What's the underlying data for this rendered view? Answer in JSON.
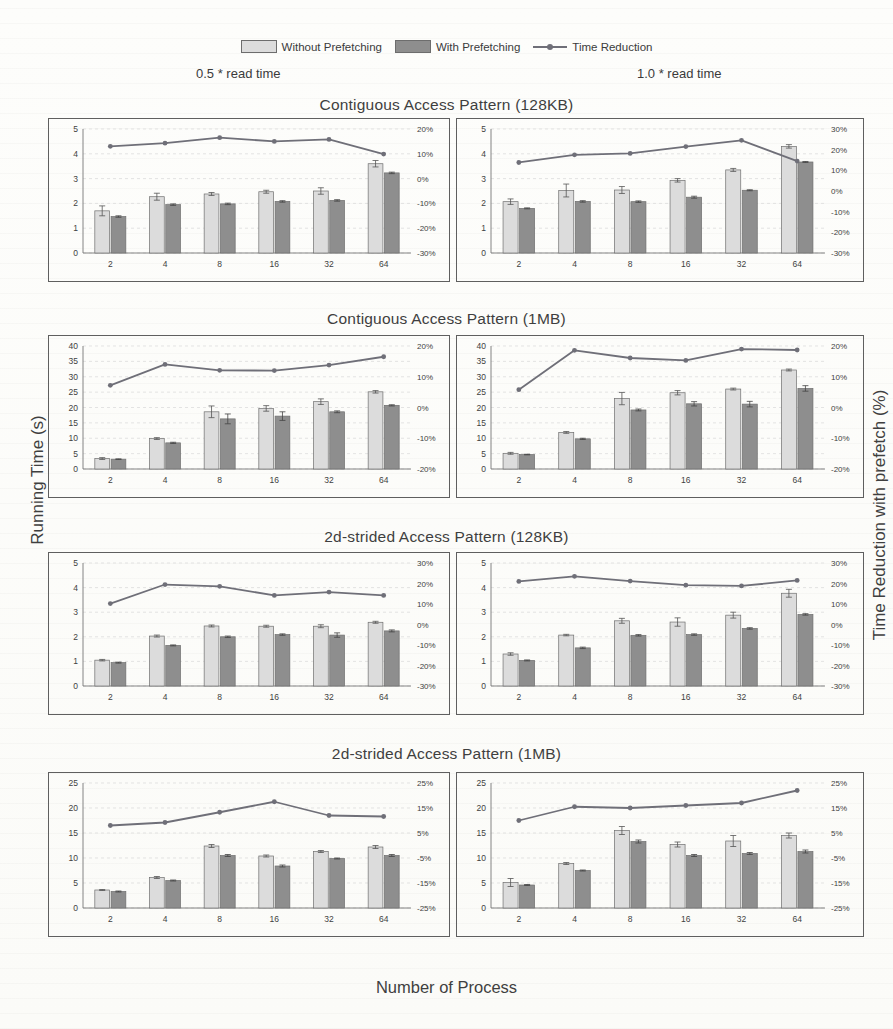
{
  "legend": {
    "items": [
      {
        "key": "without",
        "label": "Without Prefetching",
        "type": "bar",
        "color": "#dcdcdc"
      },
      {
        "key": "with",
        "label": "With Prefetching",
        "type": "bar",
        "color": "#8e8e8e"
      },
      {
        "key": "reduction",
        "label": "Time Reduction",
        "type": "line",
        "color": "#6f6f78"
      }
    ]
  },
  "column_headers": {
    "left": "0.5 * read time",
    "right": "1.0 * read time"
  },
  "axes": {
    "ylabel_left": "Running Time (s)",
    "ylabel_right": "Time Reduction with prefetch (%)",
    "xlabel": "Number of Process"
  },
  "row_titles": [
    "Contiguous Access Pattern (128KB)",
    "Contiguous Access Pattern (1MB)",
    "2d-strided Access Pattern (128KB)",
    "2d-strided Access Pattern (1MB)"
  ],
  "chart_data": [
    {
      "id": "contig-128kb-05",
      "type": "bar",
      "title": "Contiguous Access Pattern (128KB)",
      "subtitle": "0.5 * read time",
      "xlabel": "Number of Process",
      "ylabel": "Running Time (s)",
      "y2label": "Time Reduction with prefetch (%)",
      "categories": [
        "2",
        "4",
        "8",
        "16",
        "32",
        "64"
      ],
      "ylim": [
        0,
        5
      ],
      "yticks": [
        0,
        1,
        2,
        3,
        4,
        5
      ],
      "y2lim": [
        -30,
        20
      ],
      "y2ticks": [
        -30,
        -20,
        -10,
        0,
        10,
        20
      ],
      "y2ticklabels": [
        "-30%",
        "-20%",
        "-10%",
        "0%",
        "10%",
        "20%"
      ],
      "grid": true,
      "legend_position": "top",
      "series": [
        {
          "name": "Without Prefetching",
          "axis": "left",
          "values": [
            1.7,
            2.27,
            2.38,
            2.47,
            2.5,
            3.6
          ],
          "errors": [
            0.2,
            0.14,
            0.06,
            0.06,
            0.13,
            0.13
          ]
        },
        {
          "name": "With Prefetching",
          "axis": "left",
          "values": [
            1.47,
            1.95,
            1.98,
            2.08,
            2.12,
            3.23
          ],
          "errors": [
            0.03,
            0.03,
            0.03,
            0.03,
            0.03,
            0.03
          ]
        },
        {
          "name": "Time Reduction",
          "axis": "right",
          "values": [
            13.0,
            14.3,
            16.5,
            15.0,
            15.8,
            9.9
          ]
        }
      ]
    },
    {
      "id": "contig-128kb-10",
      "type": "bar",
      "title": "Contiguous Access Pattern (128KB)",
      "subtitle": "1.0 * read time",
      "xlabel": "Number of Process",
      "ylabel": "Running Time (s)",
      "y2label": "Time Reduction with prefetch (%)",
      "categories": [
        "2",
        "4",
        "8",
        "16",
        "32",
        "64"
      ],
      "ylim": [
        0,
        5
      ],
      "yticks": [
        0,
        1,
        2,
        3,
        4,
        5
      ],
      "y2lim": [
        -30,
        30
      ],
      "y2ticks": [
        -30,
        -20,
        -10,
        0,
        10,
        20,
        30
      ],
      "y2ticklabels": [
        "-30%",
        "-20%",
        "-10%",
        "0%",
        "10%",
        "20%",
        "30%"
      ],
      "grid": true,
      "legend_position": "top",
      "series": [
        {
          "name": "Without Prefetching",
          "axis": "left",
          "values": [
            2.07,
            2.52,
            2.54,
            2.93,
            3.35,
            4.3
          ],
          "errors": [
            0.11,
            0.26,
            0.14,
            0.07,
            0.06,
            0.07
          ]
        },
        {
          "name": "With Prefetching",
          "axis": "left",
          "values": [
            1.8,
            2.08,
            2.07,
            2.25,
            2.53,
            3.67
          ],
          "errors": [
            0.02,
            0.03,
            0.03,
            0.04,
            0.02,
            0.02
          ]
        },
        {
          "name": "Time Reduction",
          "axis": "right",
          "values": [
            13.8,
            17.5,
            18.2,
            21.5,
            24.5,
            14.5
          ]
        }
      ]
    },
    {
      "id": "contig-1mb-05",
      "type": "bar",
      "title": "Contiguous Access Pattern (1MB)",
      "subtitle": "0.5 * read time",
      "xlabel": "Number of Process",
      "ylabel": "Running Time (s)",
      "y2label": "Time Reduction with prefetch (%)",
      "categories": [
        "2",
        "4",
        "8",
        "16",
        "32",
        "64"
      ],
      "ylim": [
        0,
        40
      ],
      "yticks": [
        0,
        5,
        10,
        15,
        20,
        25,
        30,
        35,
        40
      ],
      "y2lim": [
        -20,
        20
      ],
      "y2ticks": [
        -20,
        -10,
        0,
        10,
        20
      ],
      "y2ticklabels": [
        "-20%",
        "-10%",
        "0%",
        "10%",
        "20%"
      ],
      "grid": true,
      "legend_position": "top",
      "series": [
        {
          "name": "Without Prefetching",
          "axis": "left",
          "values": [
            3.4,
            9.9,
            18.6,
            19.7,
            21.9,
            25.1
          ],
          "errors": [
            0.3,
            0.3,
            1.9,
            0.9,
            0.9,
            0.4
          ]
        },
        {
          "name": "With Prefetching",
          "axis": "left",
          "values": [
            3.2,
            8.5,
            16.3,
            17.2,
            18.6,
            20.7
          ],
          "errors": [
            0.1,
            0.2,
            1.6,
            1.4,
            0.3,
            0.2
          ]
        },
        {
          "name": "Time Reduction",
          "axis": "right",
          "values": [
            7.2,
            14.0,
            12.1,
            12.0,
            13.8,
            16.5
          ]
        }
      ]
    },
    {
      "id": "contig-1mb-10",
      "type": "bar",
      "title": "Contiguous Access Pattern (1MB)",
      "subtitle": "1.0 * read time",
      "xlabel": "Number of Process",
      "ylabel": "Running Time (s)",
      "y2label": "Time Reduction with prefetch (%)",
      "categories": [
        "2",
        "4",
        "8",
        "16",
        "32",
        "64"
      ],
      "ylim": [
        0,
        40
      ],
      "yticks": [
        0,
        5,
        10,
        15,
        20,
        25,
        30,
        35,
        40
      ],
      "y2lim": [
        -20,
        20
      ],
      "y2ticks": [
        -20,
        -10,
        0,
        10,
        20
      ],
      "y2ticklabels": [
        "-20%",
        "-10%",
        "0%",
        "10%",
        "20%"
      ],
      "grid": true,
      "legend_position": "top",
      "series": [
        {
          "name": "Without Prefetching",
          "axis": "left",
          "values": [
            5.1,
            11.9,
            22.9,
            24.8,
            26.0,
            32.2
          ],
          "errors": [
            0.3,
            0.3,
            2.0,
            0.7,
            0.3,
            0.3
          ]
        },
        {
          "name": "With Prefetching",
          "axis": "left",
          "values": [
            4.7,
            9.8,
            19.2,
            21.2,
            21.1,
            26.2
          ],
          "errors": [
            0.1,
            0.2,
            0.3,
            0.7,
            0.9,
            0.9
          ]
        },
        {
          "name": "Time Reduction",
          "axis": "right",
          "values": [
            5.8,
            18.6,
            16.1,
            15.3,
            19.0,
            18.7
          ]
        }
      ]
    },
    {
      "id": "strided-128kb-05",
      "type": "bar",
      "title": "2d-strided Access Pattern (128KB)",
      "subtitle": "0.5 * read time",
      "xlabel": "Number of Process",
      "ylabel": "Running Time (s)",
      "y2label": "Time Reduction with prefetch (%)",
      "categories": [
        "2",
        "4",
        "8",
        "16",
        "32",
        "64"
      ],
      "ylim": [
        0,
        5
      ],
      "yticks": [
        0,
        1,
        2,
        3,
        4,
        5
      ],
      "y2lim": [
        -30,
        30
      ],
      "y2ticks": [
        -30,
        -20,
        -10,
        0,
        10,
        20,
        30
      ],
      "y2ticklabels": [
        "-30%",
        "-20%",
        "-10%",
        "0%",
        "10%",
        "20%",
        "30%"
      ],
      "grid": true,
      "legend_position": "top",
      "series": [
        {
          "name": "Without Prefetching",
          "axis": "left",
          "values": [
            1.05,
            2.03,
            2.44,
            2.43,
            2.43,
            2.59
          ],
          "errors": [
            0.03,
            0.04,
            0.04,
            0.04,
            0.06,
            0.04
          ]
        },
        {
          "name": "With Prefetching",
          "axis": "left",
          "values": [
            0.95,
            1.65,
            2.0,
            2.09,
            2.07,
            2.24
          ],
          "errors": [
            0.02,
            0.02,
            0.03,
            0.03,
            0.09,
            0.04
          ]
        },
        {
          "name": "Time Reduction",
          "axis": "right",
          "values": [
            10.2,
            19.5,
            18.6,
            14.2,
            15.8,
            14.2
          ]
        }
      ]
    },
    {
      "id": "strided-128kb-10",
      "type": "bar",
      "title": "2d-strided Access Pattern (128KB)",
      "subtitle": "1.0 * read time",
      "xlabel": "Number of Process",
      "ylabel": "Running Time (s)",
      "y2label": "Time Reduction with prefetch (%)",
      "categories": [
        "2",
        "4",
        "8",
        "16",
        "32",
        "64"
      ],
      "ylim": [
        0,
        5
      ],
      "yticks": [
        0,
        1,
        2,
        3,
        4,
        5
      ],
      "y2lim": [
        -30,
        30
      ],
      "y2ticks": [
        -30,
        -20,
        -10,
        0,
        10,
        20,
        30
      ],
      "y2ticklabels": [
        "-30%",
        "-20%",
        "-10%",
        "0%",
        "10%",
        "20%",
        "30%"
      ],
      "grid": true,
      "legend_position": "top",
      "series": [
        {
          "name": "Without Prefetching",
          "axis": "left",
          "values": [
            1.3,
            2.07,
            2.65,
            2.6,
            2.88,
            3.77
          ],
          "errors": [
            0.05,
            0.03,
            0.1,
            0.17,
            0.12,
            0.16
          ]
        },
        {
          "name": "With Prefetching",
          "axis": "left",
          "values": [
            1.04,
            1.55,
            2.06,
            2.09,
            2.34,
            2.91
          ],
          "errors": [
            0.02,
            0.03,
            0.03,
            0.03,
            0.03,
            0.03
          ]
        },
        {
          "name": "Time Reduction",
          "axis": "right",
          "values": [
            21.0,
            23.5,
            21.2,
            19.2,
            18.8,
            21.5
          ]
        }
      ]
    },
    {
      "id": "strided-1mb-05",
      "type": "bar",
      "title": "2d-strided Access Pattern (1MB)",
      "subtitle": "0.5 * read time",
      "xlabel": "Number of Process",
      "ylabel": "Running Time (s)",
      "y2label": "Time Reduction with prefetch (%)",
      "categories": [
        "2",
        "4",
        "8",
        "16",
        "32",
        "64"
      ],
      "ylim": [
        0,
        25
      ],
      "yticks": [
        0,
        5,
        10,
        15,
        20,
        25
      ],
      "y2lim": [
        -25,
        25
      ],
      "y2ticks": [
        -25,
        -15,
        -5,
        5,
        15,
        25
      ],
      "y2ticklabels": [
        "-25%",
        "-15%",
        "-5%",
        "5%",
        "15%",
        "25%"
      ],
      "grid": true,
      "legend_position": "top",
      "series": [
        {
          "name": "Without Prefetching",
          "axis": "left",
          "values": [
            3.6,
            6.1,
            12.4,
            10.4,
            11.3,
            12.2
          ],
          "errors": [
            0.1,
            0.2,
            0.3,
            0.2,
            0.2,
            0.3
          ]
        },
        {
          "name": "With Prefetching",
          "axis": "left",
          "values": [
            3.3,
            5.5,
            10.5,
            8.4,
            9.9,
            10.5
          ],
          "errors": [
            0.1,
            0.1,
            0.2,
            0.2,
            0.1,
            0.2
          ]
        },
        {
          "name": "Time Reduction",
          "axis": "right",
          "values": [
            8.0,
            9.2,
            13.3,
            17.5,
            12.0,
            11.6
          ]
        }
      ]
    },
    {
      "id": "strided-1mb-10",
      "type": "bar",
      "title": "2d-strided Access Pattern (1MB)",
      "subtitle": "1.0 * read time",
      "xlabel": "Number of Process",
      "ylabel": "Running Time (s)",
      "y2label": "Time Reduction with prefetch (%)",
      "categories": [
        "2",
        "4",
        "8",
        "16",
        "32",
        "64"
      ],
      "ylim": [
        0,
        25
      ],
      "yticks": [
        0,
        5,
        10,
        15,
        20,
        25
      ],
      "y2lim": [
        -25,
        25
      ],
      "y2ticks": [
        -25,
        -15,
        -5,
        5,
        15,
        25
      ],
      "y2ticklabels": [
        "-25%",
        "-15%",
        "-5%",
        "5%",
        "15%",
        "25%"
      ],
      "grid": true,
      "legend_position": "top",
      "series": [
        {
          "name": "Without Prefetching",
          "axis": "left",
          "values": [
            5.1,
            8.9,
            15.5,
            12.7,
            13.4,
            14.5
          ],
          "errors": [
            0.8,
            0.2,
            0.8,
            0.5,
            1.1,
            0.5
          ]
        },
        {
          "name": "With Prefetching",
          "axis": "left",
          "values": [
            4.6,
            7.5,
            13.3,
            10.5,
            10.9,
            11.3
          ],
          "errors": [
            0.1,
            0.1,
            0.3,
            0.2,
            0.2,
            0.3
          ]
        },
        {
          "name": "Time Reduction",
          "axis": "right",
          "values": [
            10.0,
            15.5,
            15.0,
            16.0,
            17.0,
            22.0
          ]
        }
      ]
    }
  ],
  "panel_layout": [
    {
      "chart": 0,
      "left": 48,
      "top": 118,
      "width": 402,
      "height": 164
    },
    {
      "chart": 1,
      "left": 456,
      "top": 118,
      "width": 408,
      "height": 164
    },
    {
      "chart": 2,
      "left": 48,
      "top": 335,
      "width": 402,
      "height": 163
    },
    {
      "chart": 3,
      "left": 456,
      "top": 335,
      "width": 408,
      "height": 163
    },
    {
      "chart": 4,
      "left": 48,
      "top": 552,
      "width": 402,
      "height": 163
    },
    {
      "chart": 5,
      "left": 456,
      "top": 552,
      "width": 408,
      "height": 163
    },
    {
      "chart": 6,
      "left": 48,
      "top": 772,
      "width": 402,
      "height": 165
    },
    {
      "chart": 7,
      "left": 456,
      "top": 772,
      "width": 408,
      "height": 165
    }
  ],
  "row_title_tops": [
    96,
    310,
    528,
    745
  ],
  "colors": {
    "bar_without": "#dcdcdc",
    "bar_with": "#8e8e8e",
    "bar_edge": "#6f6f6f",
    "line": "#6f6f78",
    "grid": "#d8d8d8",
    "frame": "#5f5f5f",
    "text": "#3f3f3f"
  }
}
